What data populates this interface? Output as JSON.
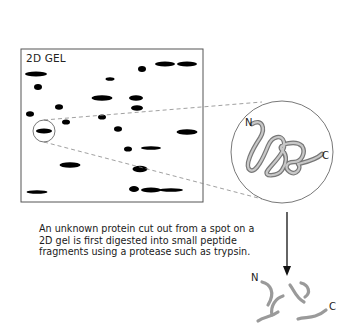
{
  "gel": {
    "label": "2D GEL",
    "frame": {
      "x": 21,
      "y": 49,
      "w": 182,
      "h": 153
    },
    "spots": [
      {
        "cx": 36,
        "cy": 74,
        "rx": 11,
        "ry": 2.6
      },
      {
        "cx": 38,
        "cy": 87,
        "rx": 4,
        "ry": 3
      },
      {
        "cx": 110,
        "cy": 79,
        "rx": 4.5,
        "ry": 1.8
      },
      {
        "cx": 142,
        "cy": 69,
        "rx": 4,
        "ry": 3
      },
      {
        "cx": 165,
        "cy": 64,
        "rx": 10,
        "ry": 2.6
      },
      {
        "cx": 187,
        "cy": 64,
        "rx": 10,
        "ry": 2.6
      },
      {
        "cx": 102,
        "cy": 98,
        "rx": 10.5,
        "ry": 2.8
      },
      {
        "cx": 136,
        "cy": 98,
        "rx": 7,
        "ry": 2.8
      },
      {
        "cx": 59,
        "cy": 107,
        "rx": 4,
        "ry": 2.8
      },
      {
        "cx": 137,
        "cy": 108,
        "rx": 6,
        "ry": 2.8
      },
      {
        "cx": 30,
        "cy": 114,
        "rx": 4,
        "ry": 2.8
      },
      {
        "cx": 102,
        "cy": 117,
        "rx": 4,
        "ry": 2.6
      },
      {
        "cx": 66,
        "cy": 122,
        "rx": 4,
        "ry": 2.6
      },
      {
        "cx": 44,
        "cy": 131,
        "rx": 8,
        "ry": 2.6
      },
      {
        "cx": 118,
        "cy": 129,
        "rx": 4,
        "ry": 2.8
      },
      {
        "cx": 187,
        "cy": 132,
        "rx": 10.5,
        "ry": 2.8
      },
      {
        "cx": 128,
        "cy": 149,
        "rx": 4,
        "ry": 2.6
      },
      {
        "cx": 151,
        "cy": 148,
        "rx": 10,
        "ry": 1.8
      },
      {
        "cx": 70,
        "cy": 165,
        "rx": 10.5,
        "ry": 2.8
      },
      {
        "cx": 140,
        "cy": 169,
        "rx": 7.5,
        "ry": 3.2
      },
      {
        "cx": 37,
        "cy": 192,
        "rx": 10.5,
        "ry": 1.8
      },
      {
        "cx": 134,
        "cy": 189,
        "rx": 5,
        "ry": 3
      },
      {
        "cx": 151,
        "cy": 190,
        "rx": 10,
        "ry": 2.6
      },
      {
        "cx": 171,
        "cy": 190,
        "rx": 12,
        "ry": 1.8
      }
    ]
  },
  "zoom": {
    "small_circle": {
      "cx": 44,
      "cy": 131,
      "r": 11
    },
    "big_circle": {
      "cx": 282,
      "cy": 152,
      "r": 51
    }
  },
  "protein": {
    "n_label": "N",
    "c_label": "C"
  },
  "caption": {
    "lines": [
      "An unknown protein cut out from a spot on a",
      "2D gel is first digested into small peptide",
      "fragments using a protease such as trypsin."
    ]
  },
  "fragments": {
    "n_label": "N",
    "c_label": "C"
  },
  "colors": {
    "spot": "#000000",
    "frame": "#555555",
    "dash": "#888888",
    "chain": "#9a9a9a"
  }
}
